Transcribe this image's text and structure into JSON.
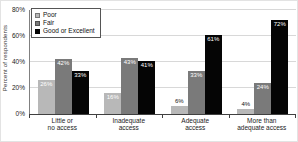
{
  "chart": {
    "y_axis_title": "Percent of respondents",
    "y_ticks": [
      {
        "label": "80%",
        "value": 80
      },
      {
        "label": "60%",
        "value": 60
      },
      {
        "label": "40%",
        "value": 40
      },
      {
        "label": "20%",
        "value": 20
      },
      {
        "label": "0%",
        "value": 0
      }
    ],
    "value_label_suffix": "%",
    "small_bar_threshold": 10
  },
  "chart_data": {
    "type": "bar",
    "title": "",
    "xlabel": "",
    "ylabel": "Percent of respondents",
    "ylim": [
      0,
      80
    ],
    "grid": true,
    "legend_position": "top-left",
    "categories": [
      [
        "Little or",
        "no access"
      ],
      [
        "Inadequate",
        "access"
      ],
      [
        "Adequate",
        "access"
      ],
      [
        "More than",
        "adequate access"
      ]
    ],
    "series": [
      {
        "name": "Poor",
        "color": "#b8b8b8",
        "values": [
          26,
          16,
          6,
          4
        ]
      },
      {
        "name": "Fair",
        "color": "#7a7a7a",
        "values": [
          42,
          43,
          33,
          24
        ]
      },
      {
        "name": "Good or Excellent",
        "color": "#050505",
        "values": [
          33,
          41,
          61,
          72
        ]
      }
    ]
  }
}
